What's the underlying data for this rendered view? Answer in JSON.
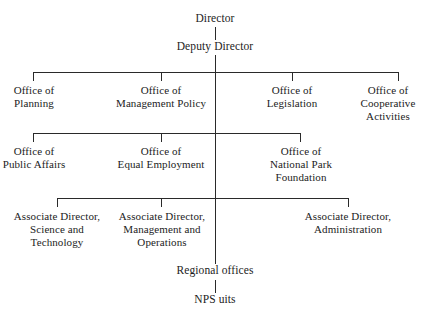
{
  "chart_title": "National Park Service Organization Chart",
  "nodes": {
    "director": "Director",
    "deputy_director": "Deputy Director",
    "office_planning": "Office of\nPlanning",
    "office_management_policy": "Office of\nManagement Policy",
    "office_legislation": "Office of\nLegislation",
    "office_cooperative_activities": "Office of\nCooperative\nActivities",
    "office_public_affairs": "Office of\nPublic Affairs",
    "office_equal_employment": "Office of\nEqual Employment",
    "office_national_park_foundation": "Office of\nNational Park\nFoundation",
    "associate_director_science": "Associate Director,\nScience and\nTechnology",
    "associate_director_management": "Associate Director,\nManagement and\nOperations",
    "associate_director_administration": "Associate Director,\nAdministration",
    "regional_offices": "Regional offices",
    "nps_units": "NPS uits"
  },
  "colors": {
    "background": "#ffffff",
    "line": "#2a2a2a",
    "text": "#1c1c1c"
  }
}
